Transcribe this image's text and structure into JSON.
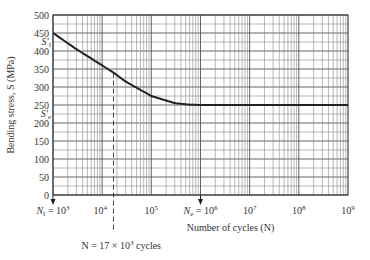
{
  "chart_data": {
    "type": "line",
    "title": "",
    "xlabel": "Number of cycles (N)",
    "ylabel": "Bending stress, S (MPa)",
    "xscale": "log",
    "xlim": [
      1000,
      1000000000
    ],
    "ylim": [
      0,
      500
    ],
    "grid": true,
    "y_ticks": [
      0,
      50,
      100,
      150,
      200,
      250,
      300,
      350,
      400,
      450,
      500
    ],
    "x_tick_labels": [
      "N_f = 10^3",
      "10^4",
      "10^5",
      "N_e = 10^6",
      "10^7",
      "10^8",
      "10^9"
    ],
    "series": [
      {
        "name": "S-N curve",
        "x": [
          1000,
          3000,
          10000,
          17000,
          30000,
          100000,
          300000,
          600000,
          1000000,
          10000000,
          100000000,
          1000000000
        ],
        "y": [
          450,
          405,
          360,
          340,
          315,
          275,
          255,
          251,
          250,
          250,
          250,
          250
        ]
      }
    ],
    "annotations": [
      {
        "text": "S_f'",
        "at_y": 450,
        "note": "fatigue strength coefficient"
      },
      {
        "text": "S_e'",
        "at_y": 250,
        "note": "endurance limit"
      },
      {
        "text": "N = 17 × 10^3 cycles",
        "at_x": 17000,
        "style": "dashed vertical line"
      },
      {
        "text": "N_f = 10^3",
        "at_x": 1000,
        "style": "arrow"
      },
      {
        "text": "N_e = 10^6",
        "at_x": 1000000,
        "style": "arrow"
      }
    ]
  },
  "labels": {
    "ylabel": "Bending stress, S (MPa)",
    "xlabel": "Number of cycles (N)",
    "n_line": "N = 17 × 10",
    "n_line_exp": "3",
    "n_line_suffix": " cycles",
    "sf": "S",
    "sf_sub": "f",
    "se": "S",
    "se_sub": "e"
  }
}
